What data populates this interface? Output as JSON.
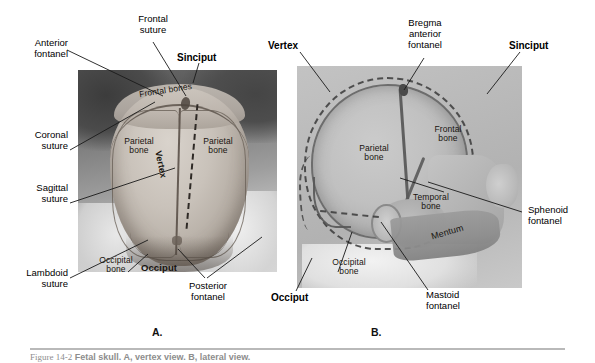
{
  "figure": {
    "panel_a_letter": "A.",
    "panel_b_letter": "B.",
    "caption_number": "Figure 14-2",
    "caption_text": "Fetal skull. A, vertex view. B, lateral view."
  },
  "panel_a": {
    "name": "vertex-view-photograph",
    "outside_labels": [
      {
        "id": "anterior-fontanel",
        "text_line1": "Anterior",
        "text_line2": "fontanel",
        "bold": false
      },
      {
        "id": "frontal-suture",
        "text_line1": "Frontal",
        "text_line2": "suture",
        "bold": false
      },
      {
        "id": "sinciput",
        "text_line1": "Sinciput",
        "text_line2": "",
        "bold": true
      },
      {
        "id": "coronal-suture",
        "text_line1": "Coronal",
        "text_line2": "suture",
        "bold": false
      },
      {
        "id": "sagittal-suture",
        "text_line1": "Sagittal",
        "text_line2": "suture",
        "bold": false
      },
      {
        "id": "lambdoid-suture",
        "text_line1": "Lambdoid",
        "text_line2": "suture",
        "bold": false
      },
      {
        "id": "posterior-fontanel",
        "text_line1": "Posterior",
        "text_line2": "fontanel",
        "bold": false
      }
    ],
    "inside_labels": [
      {
        "id": "frontal-bones",
        "text": "Frontal bones",
        "bold": false
      },
      {
        "id": "parietal-bone-left",
        "text_line1": "Parietal",
        "text_line2": "bone",
        "bold": false
      },
      {
        "id": "parietal-bone-right",
        "text_line1": "Parietal",
        "text_line2": "bone",
        "bold": false
      },
      {
        "id": "vertex",
        "text": "Vertex",
        "bold": true
      },
      {
        "id": "occipital-bone",
        "text_line1": "Occipital",
        "text_line2": "bone",
        "bold": false
      },
      {
        "id": "occiput",
        "text": "Occiput",
        "bold": true
      }
    ]
  },
  "panel_b": {
    "name": "lateral-view-photograph",
    "outside_labels": [
      {
        "id": "vertex",
        "text_line1": "Vertex",
        "text_line2": "",
        "text_line3": "",
        "bold": true
      },
      {
        "id": "bregma",
        "text_line1": "Bregma",
        "text_line2": "anterior",
        "text_line3": "fontanel",
        "bold": false
      },
      {
        "id": "sinciput",
        "text_line1": "Sinciput",
        "text_line2": "",
        "text_line3": "",
        "bold": true
      },
      {
        "id": "sphenoid-fontanel",
        "text_line1": "Sphenoid",
        "text_line2": "fontanel",
        "text_line3": "",
        "bold": false
      },
      {
        "id": "mastoid-fontanel",
        "text_line1": "Mastoid",
        "text_line2": "fontanel",
        "text_line3": "",
        "bold": false
      },
      {
        "id": "occiput",
        "text_line1": "Occiput",
        "text_line2": "",
        "text_line3": "",
        "bold": true
      }
    ],
    "inside_labels": [
      {
        "id": "parietal-bone",
        "text_line1": "Parietal",
        "text_line2": "bone"
      },
      {
        "id": "frontal-bone",
        "text_line1": "Frontal",
        "text_line2": "bone"
      },
      {
        "id": "temporal-bone",
        "text_line1": "Temporal",
        "text_line2": "bone"
      },
      {
        "id": "occipital-bone",
        "text_line1": "Occipital",
        "text_line2": "bone"
      },
      {
        "id": "mentum",
        "text_line1": "Mentum",
        "text_line2": ""
      }
    ]
  },
  "colors": {
    "page_background": "#ffffff",
    "text": "#000000",
    "leader_line": "#1a1a1a",
    "rule": "#b9b9b9",
    "caption_text": "#8d8d8d"
  }
}
